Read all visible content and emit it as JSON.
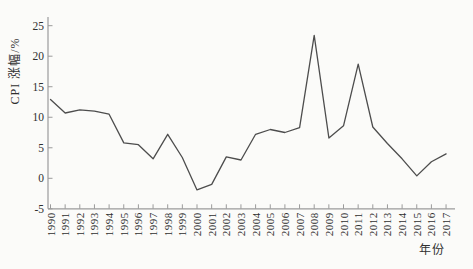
{
  "figure": {
    "background": "#fbfbf9",
    "line_color": "#4d4d4d",
    "axis_color": "#9b9b9b",
    "text_color": "#2f2f2f"
  },
  "chart_data": {
    "type": "line",
    "title": "",
    "xlabel": "年份",
    "ylabel": "CPI 涨幅/%",
    "x": [
      1990,
      1991,
      1992,
      1993,
      1994,
      1995,
      1996,
      1997,
      1998,
      1999,
      2000,
      2001,
      2002,
      2003,
      2004,
      2005,
      2006,
      2007,
      2008,
      2009,
      2010,
      2011,
      2012,
      2013,
      2014,
      2015,
      2016,
      2017
    ],
    "series": [
      {
        "name": "CPI涨幅",
        "values": [
          12.9,
          10.7,
          11.2,
          11.0,
          10.5,
          5.8,
          5.5,
          3.2,
          7.2,
          3.4,
          -1.9,
          -1.0,
          3.5,
          3.0,
          7.2,
          8.0,
          7.5,
          8.3,
          23.4,
          6.6,
          8.6,
          18.7,
          8.4,
          5.7,
          3.2,
          0.4,
          2.7,
          4.0
        ]
      }
    ],
    "ylim": [
      -5,
      25
    ],
    "yticks": [
      -5,
      0,
      5,
      10,
      15,
      20,
      25
    ],
    "grid": false,
    "legend": "none"
  }
}
